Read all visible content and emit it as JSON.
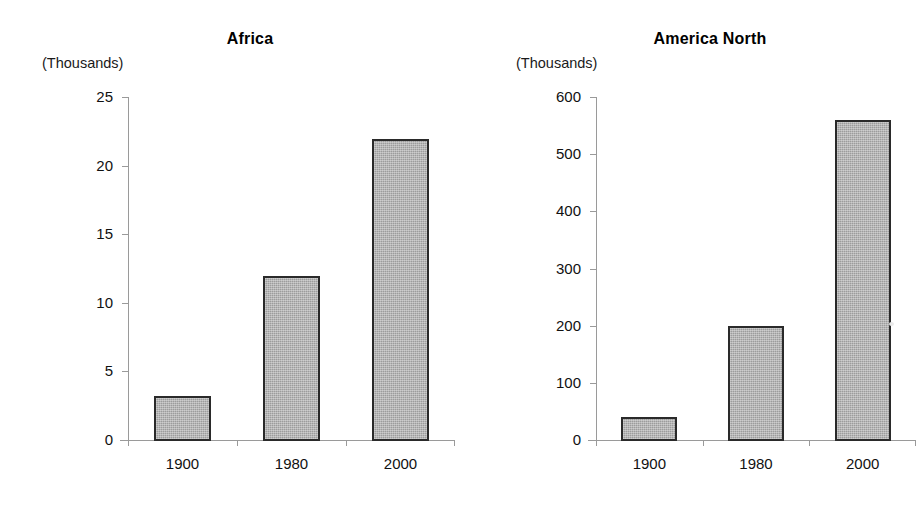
{
  "page": {
    "background": "#ffffff",
    "bar_fill": "#9c9c9c",
    "bar_stroke": "#2a2a2a",
    "axis_color": "#9a9a9a"
  },
  "chart_data": [
    {
      "type": "bar",
      "title": "Africa",
      "units_label": "(Thousands)",
      "categories": [
        "1900",
        "1980",
        "2000"
      ],
      "values": [
        3.3,
        12,
        22
      ],
      "xlabel": "",
      "ylabel": "(Thousands)",
      "ylim": [
        0,
        25
      ],
      "yticks": [
        0,
        5,
        10,
        15,
        20,
        25
      ],
      "ytick_labels": [
        "0",
        "5",
        "10",
        "15",
        "20",
        "25"
      ],
      "grid": false,
      "legend": false
    },
    {
      "type": "bar",
      "title": "America North",
      "units_label": "(Thousands)",
      "categories": [
        "1900",
        "1980",
        "2000"
      ],
      "values": [
        42,
        202,
        561
      ],
      "xlabel": "",
      "ylabel": "(Thousands)",
      "ylim": [
        0,
        600
      ],
      "yticks": [
        0,
        100,
        200,
        300,
        400,
        500,
        600
      ],
      "ytick_labels": [
        "0",
        "100",
        "200",
        "300",
        "400",
        "500",
        "600"
      ],
      "grid": false,
      "legend": false
    }
  ]
}
